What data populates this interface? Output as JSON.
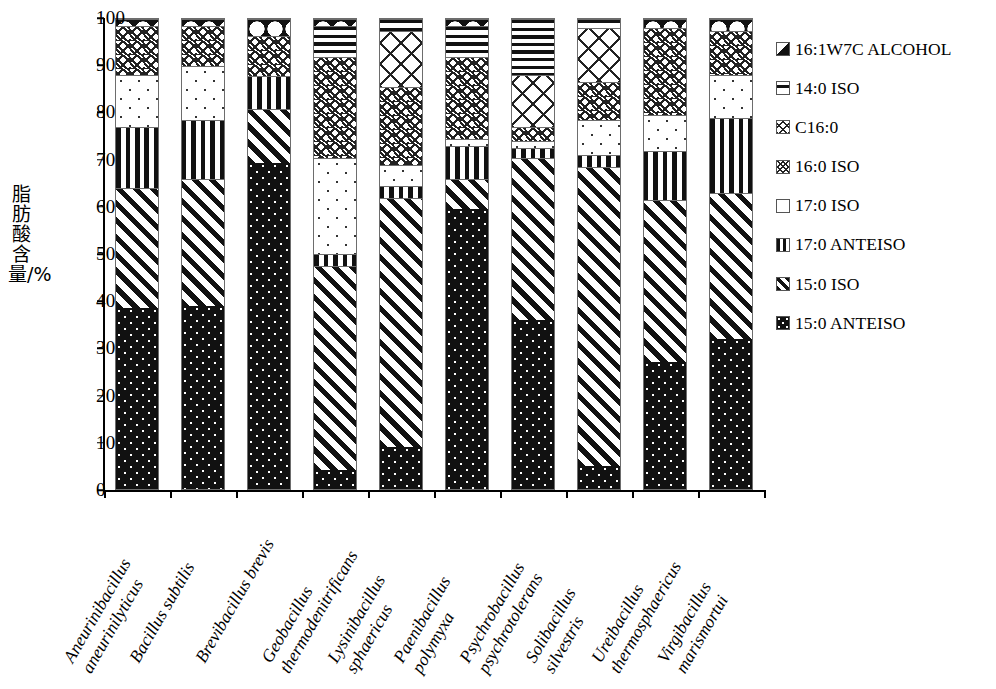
{
  "chart_data": {
    "type": "bar",
    "subtype": "stacked-bar-100",
    "title": "",
    "xlabel": "",
    "ylabel": "脂肪酸含量/%",
    "ylim": [
      0,
      100
    ],
    "ytick_step": 10,
    "ytick_labels": [
      "0",
      "10",
      "20",
      "30",
      "40",
      "50",
      "60",
      "70",
      "80",
      "90",
      "100"
    ],
    "grid": false,
    "legend_position": "right",
    "categories": [
      "Aneurinibacillus aneurinilyticus",
      "Bacillus subtilis",
      "Brevibacillus brevis",
      "Geobacillus thermodenitrificans",
      "Lysinibacillus sphaericus",
      "Paenibacillus polymyxa",
      "Psychrobacillus psychrotolerans",
      "Solibacillus silvestris",
      "Ureibacillus thermosphaericus",
      "Virgibacillus marismortui"
    ],
    "category_lines": [
      [
        "Aneurinibacillus",
        "aneurinilyticus"
      ],
      [
        "Bacillus subtilis"
      ],
      [
        "Brevibacillus brevis"
      ],
      [
        "Geobacillus",
        "thermodenitrificans"
      ],
      [
        "Lysinibacillus",
        "sphaericus"
      ],
      [
        "Paenibacillus",
        "polymyxa"
      ],
      [
        "Psychrobacillus",
        "psychrotolerans"
      ],
      [
        "Solibacillus",
        "silvestris"
      ],
      [
        "Ureibacillus",
        "thermosphaericus"
      ],
      [
        "Virgibacillus",
        "marismortui"
      ]
    ],
    "series": [
      {
        "name": "15:0 ANTEISO",
        "pattern": "p-15anteiso",
        "values": [
          38.5,
          39.0,
          69.0,
          4.0,
          9.0,
          59.5,
          36.0,
          5.0,
          27.0,
          32.0
        ]
      },
      {
        "name": "15:0 ISO",
        "pattern": "p-15iso",
        "values": [
          25.5,
          27.0,
          11.5,
          43.5,
          53.0,
          6.5,
          34.5,
          63.5,
          34.5,
          31.0
        ]
      },
      {
        "name": "17:0 ANTEISO",
        "pattern": "p-17anteiso",
        "values": [
          13.0,
          12.5,
          7.0,
          2.5,
          2.5,
          7.0,
          2.0,
          2.5,
          10.5,
          16.0
        ]
      },
      {
        "name": "17:0 ISO",
        "pattern": "p-17iso",
        "values": [
          11.0,
          11.5,
          0.0,
          20.5,
          4.5,
          1.5,
          1.5,
          7.5,
          7.5,
          9.0
        ]
      },
      {
        "name": "16:0 ISO",
        "pattern": "p-16iso",
        "values": [
          10.5,
          8.5,
          8.5,
          21.5,
          16.5,
          17.5,
          3.0,
          8.0,
          18.5,
          9.5
        ]
      },
      {
        "name": "C16:0",
        "pattern": "p-c160",
        "values": [
          0.0,
          0.0,
          0.0,
          0.0,
          12.0,
          0.0,
          11.0,
          11.5,
          0.0,
          0.0
        ]
      },
      {
        "name": "14:0 ISO",
        "pattern": "p-14iso",
        "values": [
          0.0,
          0.0,
          0.0,
          6.5,
          2.5,
          6.5,
          12.0,
          2.0,
          0.0,
          0.0
        ]
      },
      {
        "name": "16:1W7C ALCOHOL",
        "pattern": "p-16w7c",
        "values": [
          1.5,
          1.5,
          3.5,
          1.5,
          0.0,
          1.5,
          0.0,
          0.0,
          2.0,
          2.5
        ]
      }
    ],
    "legend_entries": [
      {
        "label": "16:1W7C ALCOHOL",
        "swatch": "sw-16w7c",
        "icon": "pattern-swatch-icon"
      },
      {
        "label": "14:0 ISO",
        "swatch": "sw-14iso",
        "icon": "pattern-swatch-icon"
      },
      {
        "label": "C16:0",
        "swatch": "sw-c160",
        "icon": "pattern-swatch-icon"
      },
      {
        "label": "16:0 ISO",
        "swatch": "sw-16iso",
        "icon": "pattern-swatch-icon"
      },
      {
        "label": "17:0 ISO",
        "swatch": "sw-17iso",
        "icon": "pattern-swatch-icon"
      },
      {
        "label": "17:0 ANTEISO",
        "swatch": "sw-17anteiso",
        "icon": "pattern-swatch-icon"
      },
      {
        "label": "15:0 ISO",
        "swatch": "sw-15iso",
        "icon": "pattern-swatch-icon"
      },
      {
        "label": "15:0 ANTEISO",
        "swatch": "sw-15anteiso",
        "icon": "pattern-swatch-icon"
      }
    ],
    "colors": {
      "ink": "#111111",
      "background": "#ffffff",
      "outline": "#6d6d6d"
    }
  }
}
